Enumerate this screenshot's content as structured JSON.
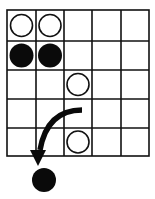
{
  "diagram": {
    "type": "board-game-position",
    "grid": {
      "columns": 5,
      "rows": 5
    },
    "stones": [
      {
        "color": "white",
        "col": 1,
        "row": 1
      },
      {
        "color": "white",
        "col": 2,
        "row": 1
      },
      {
        "color": "black",
        "col": 1,
        "row": 2
      },
      {
        "color": "black",
        "col": 2,
        "row": 2
      },
      {
        "color": "white",
        "col": 3,
        "row": 3
      },
      {
        "color": "white",
        "col": 3,
        "row": 5
      }
    ],
    "off_board_stone": {
      "color": "black",
      "position": "below column 1"
    },
    "arrow": {
      "from": "row 4, column 3",
      "to": "captured black stone below board",
      "direction": "curved down-left"
    },
    "colors": {
      "line": "#111111",
      "black_stone": "#0a0a0a",
      "white_stone": "#ffffff",
      "background": "#ffffff"
    }
  }
}
